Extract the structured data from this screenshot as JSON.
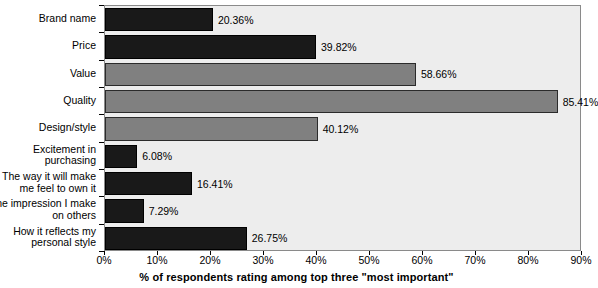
{
  "chart_data": {
    "type": "bar",
    "orientation": "horizontal",
    "title": "",
    "xlabel": "% of respondents rating among top three \"most important\"",
    "ylabel": "",
    "xlim": [
      0,
      90
    ],
    "xticks": [
      "0%",
      "10%",
      "20%",
      "30%",
      "40%",
      "50%",
      "60%",
      "70%",
      "80%",
      "90%"
    ],
    "xtick_values": [
      0,
      10,
      20,
      30,
      40,
      50,
      60,
      70,
      80,
      90
    ],
    "grid": false,
    "legend": "none",
    "categories": [
      "Brand name",
      "Price",
      "Value",
      "Quality",
      "Design/style",
      "Excitement in purchasing",
      "The way it will make me feel to own it",
      "The impression I make on others",
      "How it reflects my personal style"
    ],
    "category_lines": [
      [
        "Brand name"
      ],
      [
        "Price"
      ],
      [
        "Value"
      ],
      [
        "Quality"
      ],
      [
        "Design/style"
      ],
      [
        "Excitement in",
        "purchasing"
      ],
      [
        "The way it will make",
        "me feel to own it"
      ],
      [
        "The impression I make",
        "on others"
      ],
      [
        "How it reflects my",
        "personal style"
      ]
    ],
    "values": [
      20.36,
      39.82,
      58.66,
      85.41,
      40.12,
      6.08,
      16.41,
      7.29,
      26.75
    ],
    "value_labels": [
      "20.36%",
      "39.82%",
      "58.66%",
      "85.41%",
      "40.12%",
      "6.08%",
      "16.41%",
      "7.29%",
      "26.75%"
    ],
    "bar_colors": [
      "dark",
      "dark",
      "gray",
      "gray",
      "gray",
      "dark",
      "dark",
      "dark",
      "dark"
    ],
    "colors": {
      "dark_bar": "#191919",
      "gray_bar": "#808080",
      "plot_background": "#ededed",
      "page_background": "#ffffff",
      "axis_line": "#8a8a8a",
      "text": "#000000"
    }
  }
}
